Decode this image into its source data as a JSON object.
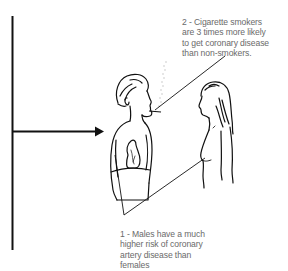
{
  "diagram": {
    "type": "illustration",
    "figures": [
      "male-smoker-figure",
      "female-figure"
    ],
    "annotations": [
      {
        "id": "1",
        "lines": [
          "1 - Males have a much",
          "higher risk of coronary",
          "artery disease than",
          "females"
        ],
        "text": "1 - Males have a much higher risk of coronary artery disease than females"
      },
      {
        "id": "2",
        "lines": [
          "2 - Cigarette smokers",
          "are 3 times more likely",
          "to get coronary disease",
          "than non-smokers."
        ],
        "text": "2 - Cigarette smokers are 3 times more likely to get coronary disease than non-smokers."
      }
    ]
  },
  "colors": {
    "line": "#111111",
    "text": "#6a6a6a",
    "background": "#ffffff"
  }
}
